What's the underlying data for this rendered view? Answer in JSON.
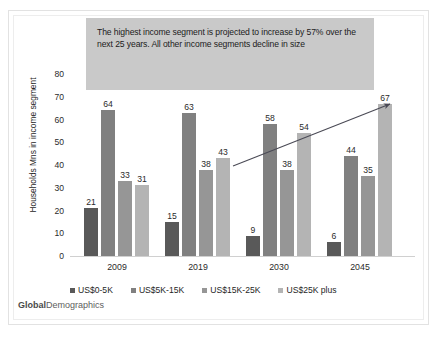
{
  "callout": {
    "text": "The highest income segment is projected to increase by 57% over the next 25 years.  All other income segments decline in size",
    "background": "#c9c9c9"
  },
  "footer": {
    "brand_bold": "Global",
    "brand_rest": "Demographics"
  },
  "colors": {
    "series_1": "#595959",
    "series_2": "#808080",
    "series_3": "#969696",
    "series_4": "#b4b4b4",
    "axis": "#d0d0d0",
    "text": "#2b2b2b",
    "arrow": "#4a4a55"
  },
  "chart_data": {
    "type": "bar",
    "title": "",
    "xlabel": "",
    "ylabel": "Households Mns in income segment",
    "ylim": [
      0,
      80
    ],
    "yticks": [
      80,
      70,
      60,
      50,
      40,
      30,
      20,
      10,
      0
    ],
    "grid": false,
    "legend_position": "bottom",
    "categories": [
      "2009",
      "2019",
      "2030",
      "2045"
    ],
    "series": [
      {
        "name": "US$0-5K",
        "color": "#595959",
        "values": [
          21,
          15,
          9,
          6
        ]
      },
      {
        "name": "US$5K-15K",
        "color": "#808080",
        "values": [
          64,
          63,
          58,
          44
        ]
      },
      {
        "name": "US$15K-25K",
        "color": "#969696",
        "values": [
          33,
          38,
          38,
          35
        ]
      },
      {
        "name": "US$25K plus",
        "color": "#b4b4b4",
        "values": [
          31,
          43,
          54,
          67
        ]
      }
    ],
    "annotations": [
      {
        "type": "arrow",
        "label": "",
        "from": [
          233,
          166
        ],
        "to": [
          390,
          104
        ]
      }
    ]
  }
}
